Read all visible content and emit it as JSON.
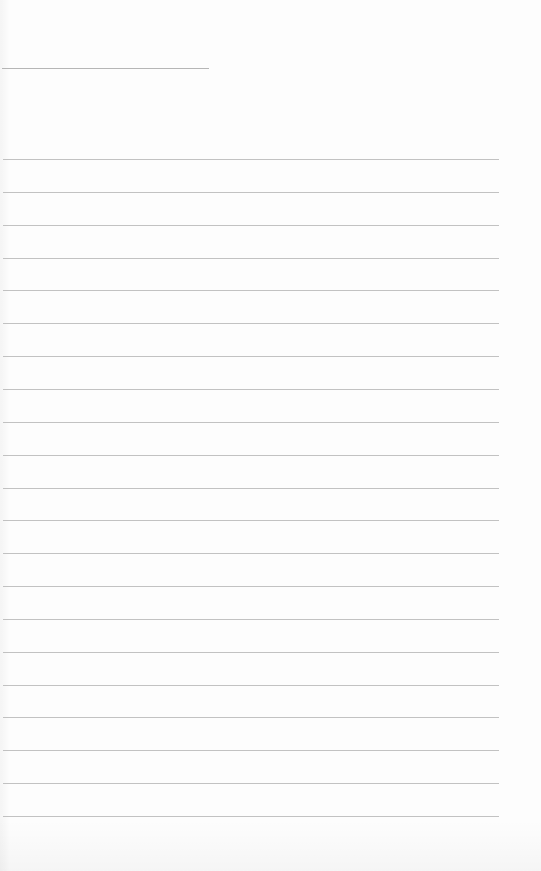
{
  "page": {
    "type": "blank ruled notebook page",
    "background_color": "#fdfdfd",
    "line_color": "#b3b3b3"
  },
  "header_line": {
    "x": 2,
    "y": 68,
    "width": 207
  },
  "ruled_lines": {
    "count": 21,
    "first_y": 159,
    "spacing": 32.85,
    "x_start": 3,
    "x_end": 499
  },
  "text_content": []
}
